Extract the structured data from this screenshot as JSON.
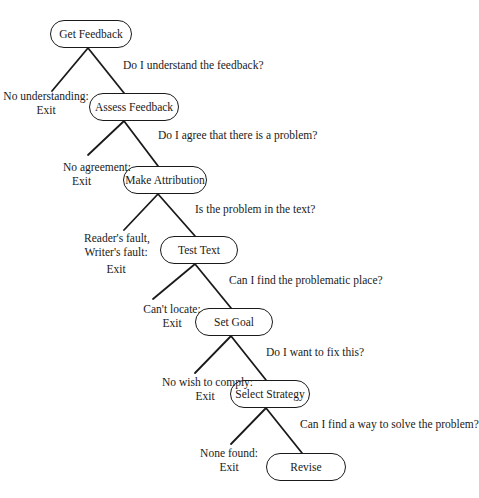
{
  "diagram": {
    "type": "decision-flow",
    "nodes": [
      {
        "id": "get-feedback",
        "label": "Get Feedback"
      },
      {
        "id": "assess-feedback",
        "label": "Assess Feedback"
      },
      {
        "id": "make-attribution",
        "label": "Make Attribution"
      },
      {
        "id": "test-text",
        "label": "Test Text"
      },
      {
        "id": "set-goal",
        "label": "Set Goal"
      },
      {
        "id": "select-strategy",
        "label": "Select Strategy"
      },
      {
        "id": "revise",
        "label": "Revise"
      }
    ],
    "questions": [
      "Do I understand the feedback?",
      "Do I agree that there is a problem?",
      "Is the problem in the text?",
      "Can I find the problematic place?",
      "Do I want to fix this?",
      "Can I find a way to solve the problem?"
    ],
    "exits": [
      {
        "line1": "No understanding:",
        "line2": "Exit"
      },
      {
        "line1": "No agreement:",
        "line2": "Exit"
      },
      {
        "line1": "Reader's fault,",
        "line2": "Writer's fault:",
        "line3": "Exit"
      },
      {
        "line1": "Can't locate:",
        "line2": "Exit"
      },
      {
        "line1": "No wish to comply:",
        "line2": "Exit"
      },
      {
        "line1": "None found:",
        "line2": "Exit"
      }
    ]
  }
}
